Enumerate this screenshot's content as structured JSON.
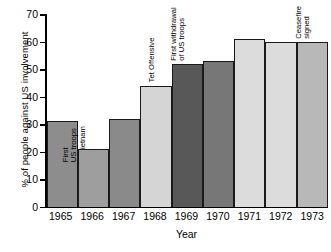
{
  "chart_data": {
    "type": "bar",
    "title": "",
    "xlabel": "Year",
    "ylabel": "% of people against US involvement",
    "categories": [
      "1965",
      "1966",
      "1967",
      "1968",
      "1969",
      "1970",
      "1971",
      "1972",
      "1973"
    ],
    "values": [
      31,
      21,
      32,
      44,
      52,
      53,
      61,
      60,
      60
    ],
    "ylim": [
      0,
      70
    ],
    "yticks": [
      0,
      10,
      20,
      30,
      40,
      50,
      60,
      70
    ],
    "ytick_labels": [
      "0",
      "10",
      "20",
      "30",
      "40",
      "50",
      "60",
      "70"
    ],
    "grid": false,
    "legend": "none",
    "bar_colors": [
      "#8d8d8d",
      "#9e9e9e",
      "#8a8a8a",
      "#d5d5d5",
      "#585858",
      "#777777",
      "#dcdcdc",
      "#dcdcdc",
      "#b8b8b8"
    ],
    "bar_edge_color": "#1a1a1a",
    "background": "#ffffff",
    "annotations": [
      {
        "category": "1965",
        "text": "First\nUS troops\nin Vietnam",
        "placement": "inside-top"
      },
      {
        "category": "1968",
        "text": "Tet Offensive",
        "placement": "above"
      },
      {
        "category": "1969",
        "text": "First withdrawal\nof US troops",
        "placement": "above"
      },
      {
        "category": "1973",
        "text": "Ceasefire\nsigned",
        "placement": "above"
      }
    ]
  }
}
